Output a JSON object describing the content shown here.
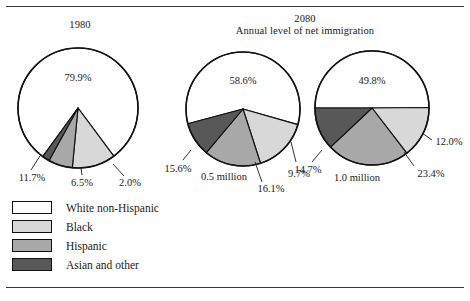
{
  "figure": {
    "rules": {
      "top": true,
      "bottom": true
    },
    "titles": {
      "left": "1980",
      "right_line1": "2080",
      "right_line2": "Annual level of net immigration"
    }
  },
  "legend": {
    "items": [
      {
        "label": "White non-Hispanic",
        "color": "#ffffff"
      },
      {
        "label": "Black",
        "color": "#d8d8d8"
      },
      {
        "label": "Hispanic",
        "color": "#a8a8a8"
      },
      {
        "label": "Asian and other",
        "color": "#585858"
      }
    ]
  },
  "chart_data": [
    {
      "type": "pie",
      "title": "1980",
      "subtitle": "",
      "categories": [
        "White non-Hispanic",
        "Black",
        "Hispanic",
        "Asian and other"
      ],
      "values": [
        79.9,
        11.7,
        6.5,
        2.0
      ],
      "labels": [
        "79.9%",
        "11.7%",
        "6.5%",
        "2.0%"
      ],
      "colors": [
        "#ffffff",
        "#d8d8d8",
        "#a8a8a8",
        "#585858"
      ],
      "units": "percent"
    },
    {
      "type": "pie",
      "title": "2080",
      "subtitle": "0.5 million",
      "categories": [
        "White non-Hispanic",
        "Black",
        "Hispanic",
        "Asian and other"
      ],
      "values": [
        58.6,
        15.6,
        16.1,
        9.7
      ],
      "labels": [
        "58.6%",
        "15.6%",
        "16.1%",
        "9.7%"
      ],
      "colors": [
        "#ffffff",
        "#d8d8d8",
        "#a8a8a8",
        "#585858"
      ],
      "units": "percent"
    },
    {
      "type": "pie",
      "title": "2080",
      "subtitle": "1.0 million",
      "categories": [
        "White non-Hispanic",
        "Black",
        "Hispanic",
        "Asian and other"
      ],
      "values": [
        49.8,
        14.7,
        23.4,
        12.0
      ],
      "labels": [
        "49.8%",
        "14.7%",
        "23.4%",
        "12.0%"
      ],
      "colors": [
        "#ffffff",
        "#d8d8d8",
        "#a8a8a8",
        "#585858"
      ],
      "units": "percent"
    }
  ],
  "annotations": {
    "pie1": {
      "inner": "79.9%",
      "black": "11.7%",
      "hispanic": "6.5%",
      "asian": "2.0%"
    },
    "pie2": {
      "inner": "58.6%",
      "black": "15.6%",
      "hispanic": "16.1%",
      "asian": "9.7%",
      "caption": "0.5 million"
    },
    "pie3": {
      "inner": "49.8%",
      "black": "14.7%",
      "hispanic": "23.4%",
      "asian": "12.0%",
      "caption": "1.0 million"
    }
  }
}
